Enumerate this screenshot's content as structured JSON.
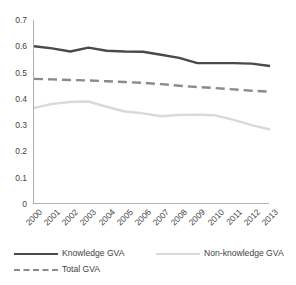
{
  "chart_data": {
    "type": "line",
    "title": "",
    "xlabel": "",
    "ylabel": "",
    "categories": [
      "2000",
      "2001",
      "2002",
      "2003",
      "2004",
      "2005",
      "2006",
      "2007",
      "2008",
      "2009",
      "2010",
      "2011",
      "2012",
      "2013"
    ],
    "ylim": [
      0,
      0.7
    ],
    "ytick_values": [
      0,
      0.1,
      0.2,
      0.3,
      0.4,
      0.5,
      0.6,
      0.7
    ],
    "ytick_labels": [
      "0",
      "0.1",
      "0.2",
      "0.3",
      "0.4",
      "0.5",
      "0.6",
      "0.7"
    ],
    "grid": false,
    "legend_position": "bottom",
    "series": [
      {
        "name": "Knowledge GVA",
        "style": "solid",
        "color": "#4a4a4a",
        "values": [
          0.6,
          0.592,
          0.58,
          0.595,
          0.583,
          0.58,
          0.579,
          0.568,
          0.556,
          0.536,
          0.536,
          0.536,
          0.534,
          0.525
        ]
      },
      {
        "name": "Non-knowledge GVA",
        "style": "solid",
        "color": "#d9d9d9",
        "values": [
          0.365,
          0.381,
          0.388,
          0.39,
          0.37,
          0.352,
          0.345,
          0.334,
          0.339,
          0.34,
          0.337,
          0.32,
          0.3,
          0.283
        ]
      },
      {
        "name": "Total GVA",
        "style": "dashed",
        "color": "#8a8a8a",
        "values": [
          0.476,
          0.474,
          0.472,
          0.47,
          0.467,
          0.464,
          0.461,
          0.456,
          0.45,
          0.445,
          0.441,
          0.436,
          0.431,
          0.427
        ]
      }
    ]
  },
  "legend": {
    "items": [
      {
        "label": "Knowledge GVA",
        "marker": "solid-dark-line-icon"
      },
      {
        "label": "Non-knowledge GVA",
        "marker": "solid-light-line-icon"
      },
      {
        "label": "Total GVA",
        "marker": "dashed-line-icon"
      }
    ]
  }
}
